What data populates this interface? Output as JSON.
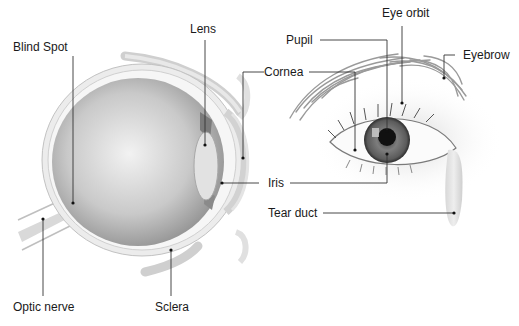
{
  "diagram": {
    "type": "anatomy-illustration",
    "panels": [
      {
        "name": "cross-section",
        "description": "Side cross-section of the eyeball"
      },
      {
        "name": "external-view",
        "description": "Front external view of the eye with eyebrow"
      }
    ],
    "labels": {
      "blind_spot": "Blind Spot",
      "lens": "Lens",
      "cornea": "Cornea",
      "pupil": "Pupil",
      "eye_orbit": "Eye orbit",
      "eyebrow": "Eyebrow",
      "iris": "Iris",
      "tear_duct": "Tear duct",
      "optic_nerve": "Optic nerve",
      "sclera": "Sclera"
    },
    "colors": {
      "background": "#ffffff",
      "label_text": "#1a1a1a",
      "leader_line": "#333333",
      "eyeball_gray": "#b8b8b8",
      "iris_gray": "#6e6e6e",
      "pupil": "#111111"
    }
  }
}
